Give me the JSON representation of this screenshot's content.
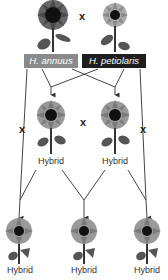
{
  "parents": {
    "left": {
      "label": "H. annuus",
      "box_color": "#8a8a8a"
    },
    "right": {
      "label": "H. petiolaris",
      "box_color": "#1e1e1e"
    },
    "cross_symbol": "x"
  },
  "f1": {
    "left_label": "Hybrid",
    "right_label": "Hybrid",
    "cross_symbol": "x"
  },
  "backcross": {
    "left_symbol": "x",
    "right_symbol": "x"
  },
  "f2": {
    "labels": [
      "Hybrid",
      "Hybrid",
      "Hybrid"
    ]
  },
  "colors": {
    "line": "#444444",
    "petal_dark": "#555555",
    "petal_light": "#9a9a9a",
    "center": "#111111",
    "leaf": "#555555"
  }
}
